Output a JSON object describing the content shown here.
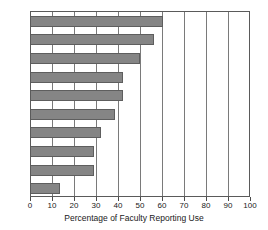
{
  "chart_data": {
    "type": "bar",
    "orientation": "horizontal",
    "title": "",
    "xlabel": "Percentage of Faculty Reporting Use",
    "ylabel": "",
    "xlim": [
      0,
      100
    ],
    "xticks": [
      0,
      10,
      20,
      30,
      40,
      50,
      60,
      70,
      80,
      90,
      100
    ],
    "xtick_labels": [
      "0",
      "10",
      "20",
      "30",
      "40",
      "50",
      "60",
      "70",
      "80",
      "90",
      "100"
    ],
    "ytick_labels": [],
    "grid": "vertical",
    "legend": "none",
    "bar_color": "#858585",
    "bar_edge_color": "#5e5e5e",
    "categories": [
      "",
      "",
      "",
      "",
      "",
      "",
      "",
      "",
      "",
      ""
    ],
    "values": [
      60,
      56,
      49.5,
      42,
      42,
      38,
      32,
      28.5,
      28.5,
      13
    ]
  },
  "axis": {
    "x_title": "Percentage of Faculty Reporting Use"
  }
}
